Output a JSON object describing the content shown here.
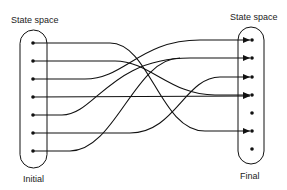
{
  "labels": {
    "left_top": "State space",
    "right_top": "State space",
    "left_bottom": "Initial",
    "right_bottom": "Final"
  },
  "diagram": {
    "type": "state-mapping",
    "initial_states": 7,
    "final_states": 7,
    "mapping": [
      {
        "from": 1,
        "to": 6
      },
      {
        "from": 2,
        "to": 4
      },
      {
        "from": 3,
        "to": 1
      },
      {
        "from": 4,
        "to": 4
      },
      {
        "from": 5,
        "to": 2
      },
      {
        "from": 6,
        "to": 3
      },
      {
        "from": 7,
        "to": 2
      }
    ],
    "unreached_final_states": [
      5,
      7
    ],
    "line_color": "#111111"
  }
}
